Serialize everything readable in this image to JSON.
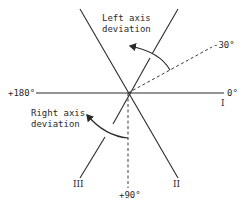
{
  "angle_labels": {
    "minus_30": "-30°",
    "zero": "0°",
    "plus_180": "+180°",
    "plus_90": "+90°"
  },
  "lead_labels": {
    "lead_I": "I",
    "lead_II": "II",
    "lead_III": "III"
  },
  "annotations": {
    "left_axis_line1": "Left axis",
    "left_axis_line2": "deviation",
    "right_axis_line1": "Right axis",
    "right_axis_line2": "deviation"
  },
  "colors": {
    "ink": "#2a2a2a",
    "background": "#ffffff"
  }
}
